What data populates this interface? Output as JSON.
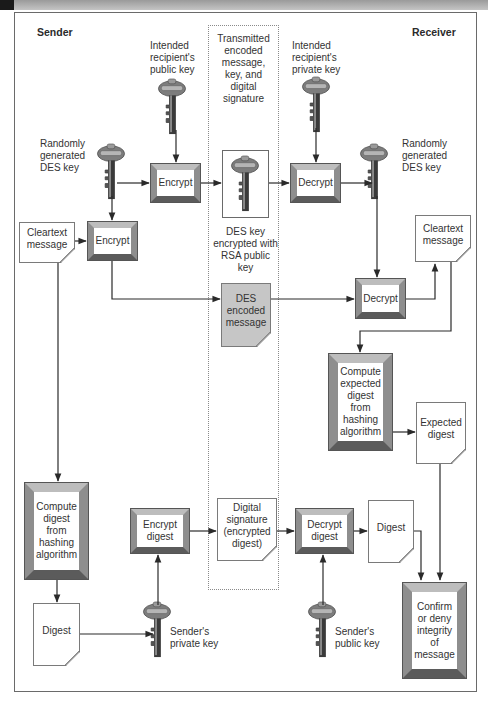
{
  "diagram": {
    "title_sender": "Sender",
    "title_receiver": "Receiver",
    "transmitted_label": "Transmitted encoded message, key, and digital signature",
    "keys": {
      "recipient_public": "Intended recipient's public key",
      "sender_des": "Randomly generated DES key",
      "recipient_private": "Intended recipient's private key",
      "receiver_des": "Randomly generated DES key",
      "sender_private": "Sender's private key",
      "sender_public": "Sender's public key",
      "encrypted_des": "DES key encrypted with RSA public key"
    },
    "processes": {
      "encrypt_key": "Encrypt",
      "encrypt_message": "Encrypt",
      "decrypt_key": "Decrypt",
      "decrypt_message": "Decrypt",
      "compute_expected": "Compute expected digest from hashing algorithm",
      "compute_digest": "Compute digest from hashing algorithm",
      "encrypt_digest": "Encrypt digest",
      "decrypt_digest": "Decrypt digest",
      "confirm": "Confirm or deny integrity of message"
    },
    "documents": {
      "cleartext_sender": "Cleartext message",
      "cleartext_receiver": "Cleartext message",
      "des_encoded": "DES encoded message",
      "expected_digest": "Expected digest",
      "digital_signature": "Digital signature (encrypted digest)",
      "digest_sender": "Digest",
      "digest_receiver": "Digest"
    },
    "colors": {
      "line": "#2a2a2a",
      "encoded_message_fill": "#c6c6c6",
      "key_fill": "#7a7a7a"
    }
  }
}
